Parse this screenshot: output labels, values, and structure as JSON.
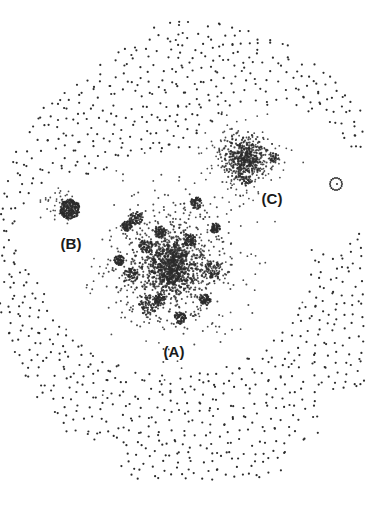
{
  "figure": {
    "node_color": "#2b2b2b",
    "background": "#ffffff"
  },
  "clusters": [
    {
      "id": "A",
      "label": "(A)",
      "role": "largest-cluster"
    },
    {
      "id": "B",
      "label": "(B)",
      "role": "small-dense-cluster"
    },
    {
      "id": "C",
      "label": "(C)",
      "role": "medium-cluster"
    }
  ],
  "labels": {
    "A": "(A)",
    "B": "(B)",
    "C": "(C)"
  }
}
